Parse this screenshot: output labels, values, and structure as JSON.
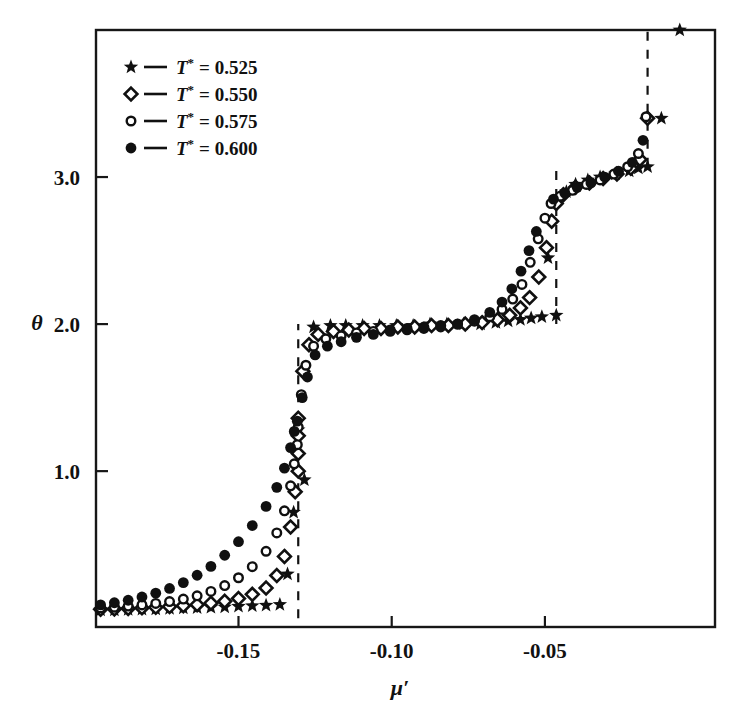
{
  "figure": {
    "title": "",
    "width": 737,
    "height": 715
  },
  "axes": {
    "x_title": "μ′",
    "y_title": "θ",
    "x_ticks": [
      {
        "value": -0.15,
        "label": "-0.15"
      },
      {
        "value": -0.1,
        "label": "-0.10"
      },
      {
        "value": -0.05,
        "label": "-0.05"
      }
    ],
    "y_ticks": [
      {
        "value": 1.0,
        "label": "1.0"
      },
      {
        "value": 2.0,
        "label": "2.0"
      },
      {
        "value": 3.0,
        "label": "3.0"
      }
    ]
  },
  "legend": {
    "position": "top-left",
    "entries": [
      {
        "marker": "filled-star",
        "symbol": "T",
        "superscript": "*",
        "equals": "=",
        "value": "0.525",
        "label": "T• = 0.525"
      },
      {
        "marker": "open-diamond",
        "symbol": "T",
        "superscript": "*",
        "equals": "=",
        "value": "0.550",
        "label": "T• = 0.550"
      },
      {
        "marker": "open-circle-small",
        "symbol": "T",
        "superscript": "*",
        "equals": "=",
        "value": "0.575",
        "label": "T• = 0.575"
      },
      {
        "marker": "filled-circle",
        "symbol": "T",
        "superscript": "*",
        "equals": "=",
        "value": "0.600",
        "label": "T• = 0.600"
      }
    ]
  },
  "annotations": {
    "vertical_dashed_lines": [
      {
        "x": -0.1305,
        "y_from": 0.0,
        "y_to": 2.0,
        "name": "first-layer-transition"
      },
      {
        "x": -0.0463,
        "y_from": 2.0,
        "y_to": 3.05,
        "name": "second-layer-transition"
      },
      {
        "x": -0.0165,
        "y_from": 3.07,
        "y_to": 4.0,
        "name": "third-layer-transition"
      }
    ]
  },
  "chart_data": {
    "type": "scatter",
    "title": "",
    "xlabel": "μ′",
    "ylabel": "θ",
    "xlim": [
      -0.1965,
      0.0055
    ],
    "ylim": [
      -0.06,
      4.0
    ],
    "grid": false,
    "legend_position": "top-left",
    "colors": {
      "marker": "#101010",
      "axis": "#171717",
      "dashed": "#121212"
    },
    "series": [
      {
        "name": "T* = 0.525",
        "marker": "filled-star",
        "points": [
          [
            -0.195,
            0.055
          ],
          [
            -0.1905,
            0.055
          ],
          [
            -0.186,
            0.058
          ],
          [
            -0.1815,
            0.06
          ],
          [
            -0.177,
            0.062
          ],
          [
            -0.1725,
            0.065
          ],
          [
            -0.168,
            0.068
          ],
          [
            -0.1635,
            0.07
          ],
          [
            -0.159,
            0.073
          ],
          [
            -0.1545,
            0.076
          ],
          [
            -0.15,
            0.08
          ],
          [
            -0.1455,
            0.084
          ],
          [
            -0.141,
            0.088
          ],
          [
            -0.1365,
            0.093
          ],
          [
            -0.134,
            0.3
          ],
          [
            -0.132,
            0.72
          ],
          [
            -0.1305,
            1.28
          ],
          [
            -0.1285,
            0.94
          ],
          [
            -0.1255,
            1.98
          ],
          [
            -0.12,
            1.99
          ],
          [
            -0.115,
            1.99
          ],
          [
            -0.1095,
            1.99
          ],
          [
            -0.104,
            1.99
          ],
          [
            -0.0985,
            1.99
          ],
          [
            -0.093,
            1.99
          ],
          [
            -0.0875,
            2.0
          ],
          [
            -0.082,
            2.0
          ],
          [
            -0.0765,
            2.0
          ],
          [
            -0.071,
            2.0
          ],
          [
            -0.066,
            2.01
          ],
          [
            -0.062,
            2.02
          ],
          [
            -0.058,
            2.03
          ],
          [
            -0.0545,
            2.04
          ],
          [
            -0.051,
            2.05
          ],
          [
            -0.049,
            2.45
          ],
          [
            -0.0463,
            2.06
          ],
          [
            -0.043,
            2.9
          ],
          [
            -0.04,
            2.95
          ],
          [
            -0.036,
            2.98
          ],
          [
            -0.032,
            3.0
          ],
          [
            -0.027,
            3.02
          ],
          [
            -0.0225,
            3.04
          ],
          [
            -0.0195,
            3.06
          ],
          [
            -0.0165,
            3.07
          ],
          [
            -0.012,
            3.4
          ],
          [
            -0.006,
            4.0
          ]
        ]
      },
      {
        "name": "T* = 0.550",
        "marker": "open-diamond",
        "points": [
          [
            -0.195,
            0.06
          ],
          [
            -0.1905,
            0.063
          ],
          [
            -0.186,
            0.066
          ],
          [
            -0.1815,
            0.07
          ],
          [
            -0.177,
            0.074
          ],
          [
            -0.1725,
            0.079
          ],
          [
            -0.168,
            0.085
          ],
          [
            -0.1635,
            0.092
          ],
          [
            -0.159,
            0.102
          ],
          [
            -0.1545,
            0.115
          ],
          [
            -0.15,
            0.134
          ],
          [
            -0.1455,
            0.162
          ],
          [
            -0.141,
            0.205
          ],
          [
            -0.1375,
            0.29
          ],
          [
            -0.135,
            0.42
          ],
          [
            -0.133,
            0.62
          ],
          [
            -0.1315,
            0.86
          ],
          [
            -0.1305,
            1.0
          ],
          [
            -0.1305,
            1.12
          ],
          [
            -0.1305,
            1.24
          ],
          [
            -0.1305,
            1.36
          ],
          [
            -0.129,
            1.68
          ],
          [
            -0.127,
            1.86
          ],
          [
            -0.124,
            1.93
          ],
          [
            -0.119,
            1.95
          ],
          [
            -0.114,
            1.96
          ],
          [
            -0.109,
            1.97
          ],
          [
            -0.1035,
            1.97
          ],
          [
            -0.098,
            1.98
          ],
          [
            -0.0925,
            1.98
          ],
          [
            -0.087,
            1.99
          ],
          [
            -0.0815,
            1.99
          ],
          [
            -0.076,
            2.0
          ],
          [
            -0.0705,
            2.01
          ],
          [
            -0.0655,
            2.03
          ],
          [
            -0.0615,
            2.06
          ],
          [
            -0.058,
            2.11
          ],
          [
            -0.055,
            2.18
          ],
          [
            -0.052,
            2.32
          ],
          [
            -0.0495,
            2.52
          ],
          [
            -0.0478,
            2.7
          ],
          [
            -0.0463,
            2.82
          ],
          [
            -0.044,
            2.88
          ],
          [
            -0.04,
            2.93
          ],
          [
            -0.0355,
            2.96
          ],
          [
            -0.031,
            2.99
          ],
          [
            -0.0265,
            3.02
          ],
          [
            -0.022,
            3.06
          ],
          [
            -0.019,
            3.12
          ],
          [
            -0.0165,
            3.4
          ]
        ]
      },
      {
        "name": "T* = 0.575",
        "marker": "open-circle-small",
        "points": [
          [
            -0.195,
            0.07
          ],
          [
            -0.1905,
            0.075
          ],
          [
            -0.186,
            0.082
          ],
          [
            -0.1815,
            0.09
          ],
          [
            -0.177,
            0.1
          ],
          [
            -0.1725,
            0.113
          ],
          [
            -0.168,
            0.13
          ],
          [
            -0.1635,
            0.152
          ],
          [
            -0.159,
            0.182
          ],
          [
            -0.1545,
            0.222
          ],
          [
            -0.15,
            0.275
          ],
          [
            -0.1455,
            0.35
          ],
          [
            -0.141,
            0.455
          ],
          [
            -0.1375,
            0.58
          ],
          [
            -0.135,
            0.73
          ],
          [
            -0.133,
            0.9
          ],
          [
            -0.1318,
            1.05
          ],
          [
            -0.1308,
            1.18
          ],
          [
            -0.1305,
            1.3
          ],
          [
            -0.1295,
            1.52
          ],
          [
            -0.128,
            1.72
          ],
          [
            -0.1255,
            1.85
          ],
          [
            -0.1215,
            1.9
          ],
          [
            -0.1165,
            1.92
          ],
          [
            -0.1115,
            1.94
          ],
          [
            -0.106,
            1.95
          ],
          [
            -0.1005,
            1.96
          ],
          [
            -0.095,
            1.97
          ],
          [
            -0.0895,
            1.98
          ],
          [
            -0.084,
            1.99
          ],
          [
            -0.0785,
            2.0
          ],
          [
            -0.073,
            2.02
          ],
          [
            -0.068,
            2.05
          ],
          [
            -0.064,
            2.1
          ],
          [
            -0.0605,
            2.17
          ],
          [
            -0.0575,
            2.27
          ],
          [
            -0.0548,
            2.42
          ],
          [
            -0.0522,
            2.58
          ],
          [
            -0.05,
            2.72
          ],
          [
            -0.048,
            2.82
          ],
          [
            -0.045,
            2.87
          ],
          [
            -0.041,
            2.91
          ],
          [
            -0.0365,
            2.95
          ],
          [
            -0.032,
            2.98
          ],
          [
            -0.0275,
            3.02
          ],
          [
            -0.023,
            3.07
          ],
          [
            -0.0195,
            3.16
          ],
          [
            -0.017,
            3.41
          ]
        ]
      },
      {
        "name": "T* = 0.600",
        "marker": "filled-circle",
        "points": [
          [
            -0.195,
            0.09
          ],
          [
            -0.1905,
            0.105
          ],
          [
            -0.186,
            0.122
          ],
          [
            -0.1815,
            0.144
          ],
          [
            -0.177,
            0.17
          ],
          [
            -0.1725,
            0.202
          ],
          [
            -0.168,
            0.242
          ],
          [
            -0.1635,
            0.292
          ],
          [
            -0.159,
            0.352
          ],
          [
            -0.1545,
            0.428
          ],
          [
            -0.15,
            0.52
          ],
          [
            -0.1455,
            0.63
          ],
          [
            -0.141,
            0.76
          ],
          [
            -0.1375,
            0.89
          ],
          [
            -0.135,
            1.02
          ],
          [
            -0.133,
            1.16
          ],
          [
            -0.1318,
            1.27
          ],
          [
            -0.1308,
            1.34
          ],
          [
            -0.1292,
            1.5
          ],
          [
            -0.1275,
            1.64
          ],
          [
            -0.125,
            1.79
          ],
          [
            -0.121,
            1.85
          ],
          [
            -0.1165,
            1.88
          ],
          [
            -0.1115,
            1.91
          ],
          [
            -0.106,
            1.93
          ],
          [
            -0.1005,
            1.95
          ],
          [
            -0.095,
            1.96
          ],
          [
            -0.0895,
            1.97
          ],
          [
            -0.084,
            1.98
          ],
          [
            -0.0785,
            2.0
          ],
          [
            -0.073,
            2.03
          ],
          [
            -0.068,
            2.08
          ],
          [
            -0.064,
            2.15
          ],
          [
            -0.0608,
            2.24
          ],
          [
            -0.0578,
            2.36
          ],
          [
            -0.0552,
            2.5
          ],
          [
            -0.0528,
            2.63
          ],
          [
            -0.0472,
            2.85
          ],
          [
            -0.0435,
            2.89
          ],
          [
            -0.0395,
            2.93
          ],
          [
            -0.035,
            2.96
          ],
          [
            -0.0305,
            3.0
          ],
          [
            -0.026,
            3.04
          ],
          [
            -0.0215,
            3.1
          ],
          [
            -0.018,
            3.25
          ]
        ]
      }
    ]
  }
}
